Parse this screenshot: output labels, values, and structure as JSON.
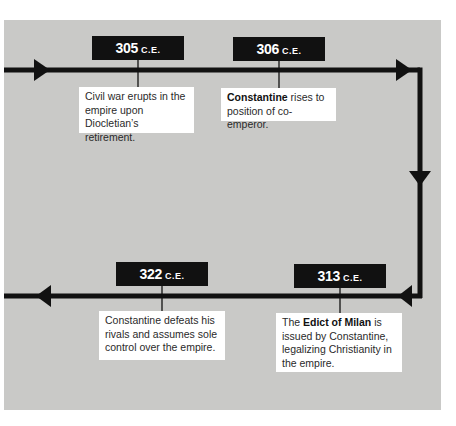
{
  "timeline": {
    "events": [
      {
        "year": "305",
        "era": "C.E.",
        "text_parts": [
          {
            "text": "Civil war erupts in the empire upon Diocletian’s retirement.",
            "bold": false
          }
        ]
      },
      {
        "year": "306",
        "era": "C.E.",
        "text_parts": [
          {
            "text": "Constantine",
            "bold": true
          },
          {
            "text": " rises to position of co-emperor.",
            "bold": false
          }
        ]
      },
      {
        "year": "313",
        "era": "C.E.",
        "text_parts": [
          {
            "text": "The ",
            "bold": false
          },
          {
            "text": "Edict of Milan",
            "bold": true
          },
          {
            "text": " is issued by Constantine, legalizing Christianity in the empire.",
            "bold": false
          }
        ]
      },
      {
        "year": "322",
        "era": "C.E.",
        "text_parts": [
          {
            "text": "Constantine defeats his rivals and assumes sole control over the empire.",
            "bold": false
          }
        ]
      }
    ],
    "colors": {
      "panel": "#c9c9c7",
      "line": "#111111",
      "label_bg": "#111111",
      "label_text": "#ffffff",
      "event_bg": "#ffffff"
    }
  }
}
